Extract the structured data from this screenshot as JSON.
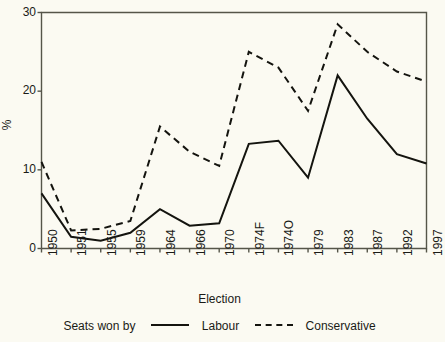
{
  "chart_data": {
    "type": "line",
    "title": "",
    "xlabel": "Election",
    "ylabel": "%",
    "categories": [
      "1950",
      "1951",
      "1955",
      "1959",
      "1964",
      "1966",
      "1970",
      "1974F",
      "1974O",
      "1979",
      "1983",
      "1987",
      "1992",
      "1997"
    ],
    "series": [
      {
        "name": "Labour",
        "style": "solid",
        "values": [
          7.0,
          1.5,
          1.0,
          2.0,
          5.0,
          2.9,
          3.2,
          13.3,
          13.7,
          9.0,
          22.0,
          16.5,
          12.0,
          10.8
        ]
      },
      {
        "name": "Conservative",
        "style": "dashed",
        "values": [
          11.0,
          2.3,
          2.5,
          3.5,
          15.5,
          12.3,
          10.5,
          25.0,
          23.0,
          17.5,
          28.5,
          25.0,
          22.5,
          21.2
        ]
      }
    ],
    "ylim": [
      0,
      30
    ],
    "yticks": [
      0,
      10,
      20,
      30
    ],
    "grid": false,
    "legend_position": "bottom",
    "legend_prefix": "Seats won by",
    "axis_color": "#4a4a40",
    "line_color": "#14140f",
    "background": "#fbfaf2"
  },
  "yticklabels": [
    "0",
    "10",
    "20",
    "30"
  ],
  "legend": {
    "prefix": "Seats won by",
    "labour_label": "Labour",
    "conservative_label": "Conservative"
  },
  "axes": {
    "x_title": "Election",
    "y_title": "%"
  }
}
